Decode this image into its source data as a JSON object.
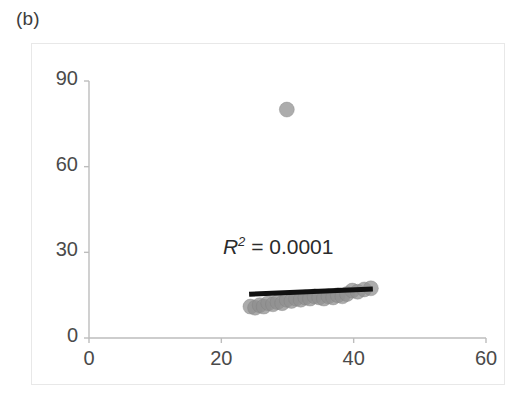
{
  "figure": {
    "panel_label": "(b)",
    "background_color": "#ffffff",
    "frame_color": "#e8e8e8"
  },
  "chart_data": {
    "type": "scatter",
    "title": "",
    "xlabel": "",
    "ylabel": "",
    "xlim": [
      0,
      60
    ],
    "ylim": [
      0,
      90
    ],
    "xticks": [
      0,
      20,
      40,
      60
    ],
    "yticks": [
      0,
      30,
      60,
      90
    ],
    "xtick_labels": [
      "0",
      "20",
      "40",
      "60"
    ],
    "ytick_labels": [
      "0",
      "30",
      "60",
      "90"
    ],
    "grid": false,
    "legend": null,
    "marker": {
      "shape": "circle",
      "color": "#909090",
      "opacity": 0.75,
      "size_px": 15
    },
    "annotations": [
      {
        "name": "r-squared",
        "prefix": "R",
        "superscript": "2",
        "equals": " = ",
        "value": "0.0001",
        "text": "R2 = 0.0001",
        "x": 29.0,
        "y": 31.5,
        "color": "#2b2b2b"
      }
    ],
    "trendline": {
      "name": "linear-fit",
      "color": "#101010",
      "width_px": 5,
      "x_start": 24.2,
      "y_start": 15.3,
      "x_end": 42.9,
      "y_end": 17.2
    },
    "points": [
      {
        "x": 29.9,
        "y": 80.0
      },
      {
        "x": 24.4,
        "y": 11.0
      },
      {
        "x": 25.1,
        "y": 10.6
      },
      {
        "x": 25.8,
        "y": 11.5
      },
      {
        "x": 26.4,
        "y": 11.0
      },
      {
        "x": 27.1,
        "y": 12.2
      },
      {
        "x": 27.8,
        "y": 11.8
      },
      {
        "x": 28.5,
        "y": 12.6
      },
      {
        "x": 29.2,
        "y": 12.2
      },
      {
        "x": 29.9,
        "y": 13.4
      },
      {
        "x": 30.6,
        "y": 13.0
      },
      {
        "x": 31.3,
        "y": 13.8
      },
      {
        "x": 32.0,
        "y": 13.4
      },
      {
        "x": 32.7,
        "y": 14.2
      },
      {
        "x": 33.4,
        "y": 13.8
      },
      {
        "x": 34.1,
        "y": 14.6
      },
      {
        "x": 34.8,
        "y": 14.2
      },
      {
        "x": 35.5,
        "y": 13.8
      },
      {
        "x": 36.2,
        "y": 14.6
      },
      {
        "x": 36.9,
        "y": 14.2
      },
      {
        "x": 37.6,
        "y": 15.0
      },
      {
        "x": 38.3,
        "y": 14.6
      },
      {
        "x": 39.0,
        "y": 15.4
      },
      {
        "x": 39.8,
        "y": 16.6
      },
      {
        "x": 40.6,
        "y": 16.2
      },
      {
        "x": 41.6,
        "y": 17.0
      },
      {
        "x": 42.6,
        "y": 17.4
      }
    ]
  }
}
